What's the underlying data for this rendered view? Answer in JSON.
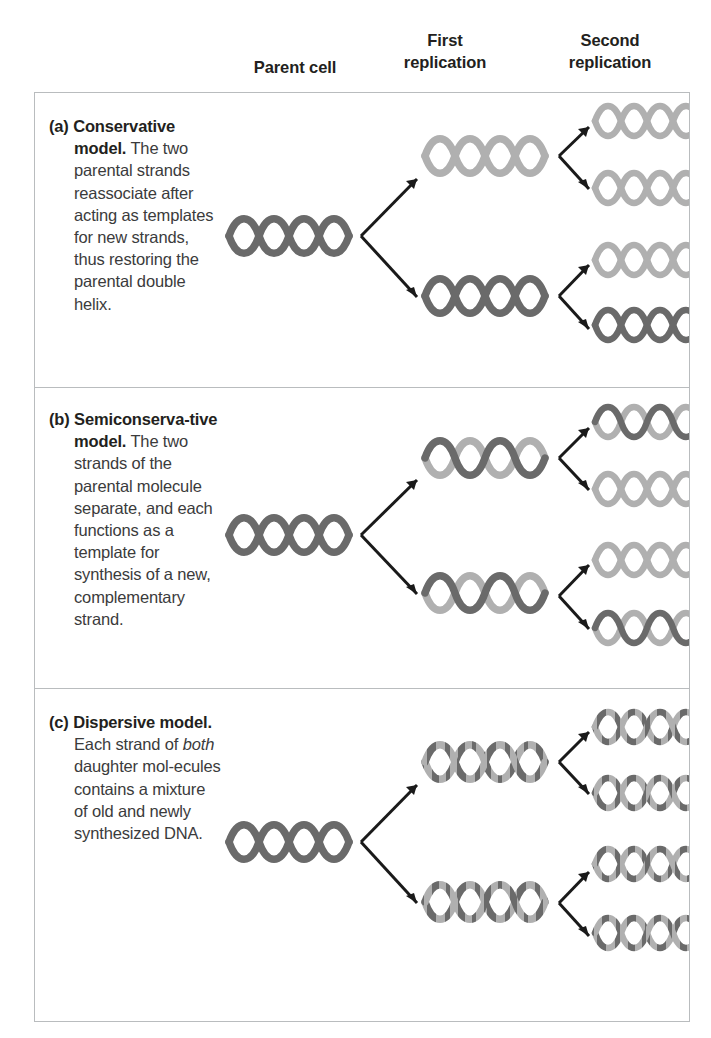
{
  "figure": {
    "type": "dna-replication-models-diagram",
    "columns": [
      {
        "id": "parent",
        "label": "Parent cell"
      },
      {
        "id": "first",
        "label": "First\nreplication"
      },
      {
        "id": "second",
        "label": "Second\nreplication"
      }
    ],
    "column_labels": {
      "parent": "Parent cell",
      "first_line1": "First",
      "first_line2": "replication",
      "second_line1": "Second",
      "second_line2": "replication"
    },
    "colors": {
      "strand_old_dark": "#6a6a6a",
      "strand_new_light": "#b0b0b0",
      "arrow": "#1a1a1a",
      "border": "#b9bcbe",
      "text": "#231f20",
      "body_text": "#3b3b3c",
      "background": "#ffffff"
    },
    "panels": [
      {
        "id": "a",
        "marker": "(a)",
        "title": "Conservative model.",
        "body_runs": [
          {
            "text": "The two parental strands reassociate after acting as templates for new strands, thus restoring the parental double helix.",
            "italic": false
          }
        ],
        "body_text": "The two parental strands reassociate after acting as templates for new strands, thus restoring the parental double helix.",
        "parent_cell": [
          {
            "strand_a": "dark",
            "strand_b": "dark",
            "pattern": "solid"
          }
        ],
        "first_replication": [
          {
            "strand_a": "light",
            "strand_b": "light",
            "pattern": "solid"
          },
          {
            "strand_a": "dark",
            "strand_b": "dark",
            "pattern": "solid"
          }
        ],
        "second_replication": [
          {
            "strand_a": "light",
            "strand_b": "light",
            "pattern": "solid"
          },
          {
            "strand_a": "light",
            "strand_b": "light",
            "pattern": "solid"
          },
          {
            "strand_a": "light",
            "strand_b": "light",
            "pattern": "solid"
          },
          {
            "strand_a": "dark",
            "strand_b": "dark",
            "pattern": "solid"
          }
        ]
      },
      {
        "id": "b",
        "marker": "(b)",
        "title": "Semiconserva-tive model.",
        "body_runs": [
          {
            "text": "The two strands of the parental molecule separate, and each functions as a template for synthesis of a new, complementary strand.",
            "italic": false
          }
        ],
        "body_text": "The two strands of the parental molecule separate, and each functions as a template for synthesis of a new, complementary strand.",
        "parent_cell": [
          {
            "strand_a": "dark",
            "strand_b": "dark",
            "pattern": "solid"
          }
        ],
        "first_replication": [
          {
            "strand_a": "dark",
            "strand_b": "light",
            "pattern": "hybrid"
          },
          {
            "strand_a": "dark",
            "strand_b": "light",
            "pattern": "hybrid"
          }
        ],
        "second_replication": [
          {
            "strand_a": "dark",
            "strand_b": "light",
            "pattern": "hybrid"
          },
          {
            "strand_a": "light",
            "strand_b": "light",
            "pattern": "solid"
          },
          {
            "strand_a": "light",
            "strand_b": "light",
            "pattern": "solid"
          },
          {
            "strand_a": "dark",
            "strand_b": "light",
            "pattern": "hybrid"
          }
        ]
      },
      {
        "id": "c",
        "marker": "(c)",
        "title": "Dispersive model.",
        "body_runs": [
          {
            "text": "Each strand of ",
            "italic": false
          },
          {
            "text": "both",
            "italic": true
          },
          {
            "text": " daughter mol-ecules contains a mixture of old and newly synthesized DNA.",
            "italic": false
          }
        ],
        "body_text": "Each strand of both daughter mol-ecules contains a mixture of old and newly synthesized DNA.",
        "parent_cell": [
          {
            "strand_a": "dark",
            "strand_b": "dark",
            "pattern": "solid"
          }
        ],
        "first_replication": [
          {
            "strand_a": "mixed",
            "strand_b": "mixed",
            "pattern": "dispersed"
          },
          {
            "strand_a": "mixed",
            "strand_b": "mixed",
            "pattern": "dispersed"
          }
        ],
        "second_replication": [
          {
            "strand_a": "mixed",
            "strand_b": "mixed",
            "pattern": "dispersed"
          },
          {
            "strand_a": "mixed",
            "strand_b": "mixed",
            "pattern": "dispersed"
          },
          {
            "strand_a": "mixed",
            "strand_b": "mixed",
            "pattern": "dispersed"
          },
          {
            "strand_a": "mixed",
            "strand_b": "mixed",
            "pattern": "dispersed"
          }
        ]
      }
    ],
    "legend_notes": {
      "dark_meaning": "old (parental) DNA strand",
      "light_meaning": "newly synthesized DNA strand"
    }
  }
}
